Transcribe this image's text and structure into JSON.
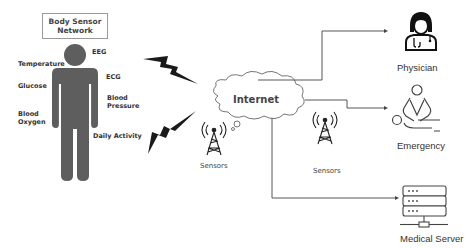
{
  "title": {
    "line1": "Body Sensor",
    "line2": "Network"
  },
  "body_labels": {
    "eeg": "EEG",
    "temperature": "Temperature",
    "ecg": "ECG",
    "glucose": "Glucose",
    "blood_pressure_1": "Blood",
    "blood_pressure_2": "Pressure",
    "blood_oxygen_1": "Blood",
    "blood_oxygen_2": "Oxygen",
    "daily_activity": "Daily Activity"
  },
  "network": {
    "cloud_label": "Internet",
    "sensor_left_label": "Sensors",
    "sensor_right_label": "Sensors"
  },
  "destinations": {
    "physician": "Physician",
    "emergency": "Emergency",
    "medical_server": "Medical Server"
  },
  "colors": {
    "figure": "#5e5e5e",
    "bolt": "#1a1a1a",
    "line": "#444444",
    "text": "#333333"
  }
}
